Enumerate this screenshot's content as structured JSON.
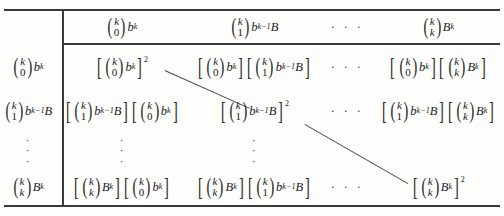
{
  "figure": {
    "type": "math-table",
    "binomial_symbols": {
      "k_choose_0": {
        "top": "k",
        "bottom": "0"
      },
      "k_choose_1": {
        "top": "k",
        "bottom": "1"
      },
      "k_choose_k": {
        "top": "k",
        "bottom": "k"
      }
    },
    "terms": {
      "t0": {
        "binom": "k_choose_0",
        "power": "b",
        "exp": "k"
      },
      "t1": {
        "binom": "k_choose_1",
        "power": "b",
        "exp": "k-1",
        "extra": "B"
      },
      "tk": {
        "binom": "k_choose_k",
        "power": "B",
        "exp": "k"
      }
    }
  },
  "header": {
    "corner": "",
    "columns": [
      {
        "id": "col-t0",
        "label": "(k 0) b^k"
      },
      {
        "id": "col-t1",
        "label": "(k 1) b^(k-1) B"
      },
      {
        "id": "col-ellipsis",
        "label": "· · ·"
      },
      {
        "id": "col-tk",
        "label": "(k k) B^k"
      }
    ]
  },
  "row_labels": [
    {
      "id": "row-t0",
      "label": "(k 0) b^k"
    },
    {
      "id": "row-t1",
      "label": "(k 1) b^(k-1) B"
    },
    {
      "id": "row-ellipsis",
      "label": "⋮"
    },
    {
      "id": "row-tk",
      "label": "(k k) B^k"
    }
  ],
  "cells": {
    "r1c1": "[(k 0) b^k]^2",
    "r1c2": "[(k 0) b^k][(k 1) b^(k-1) B]",
    "r1c3": "[(k 0) b^k][(k k) B^k]",
    "r2c1": "[(k 1) b^(k-1) B][(k 0) b^k]",
    "r2c2": "[(k 1) b^(k-1) B]^2",
    "r2c3": "[(k 1) b^(k-1) B][(k k) B^k]",
    "r3c1": "[(k k) B^k][(k 0) b^k]",
    "r3c2": "[(k k) B^k][(k 1) b^(k-1) B]",
    "r3c3": "[(k k) B^k]^2"
  },
  "ellipsis": {
    "horizontal": "· · ·",
    "vertical": "⋮"
  },
  "diagonal_lines": [
    {
      "id": "diag-1",
      "from": "r1c1",
      "to": "r2c2"
    },
    {
      "id": "diag-2",
      "from": "r2c2",
      "to": "r3c3"
    }
  ],
  "colors": {
    "rule": "#3a3a3a",
    "text": "#1a1a1a",
    "background": "#fdfdfb",
    "diagonal": "#4a4a4a"
  },
  "exponents": {
    "square": "2",
    "k": "k",
    "k_minus_1": "k-1"
  },
  "variables": {
    "b": "b",
    "B": "B",
    "k": "k",
    "zero": "0",
    "one": "1"
  }
}
